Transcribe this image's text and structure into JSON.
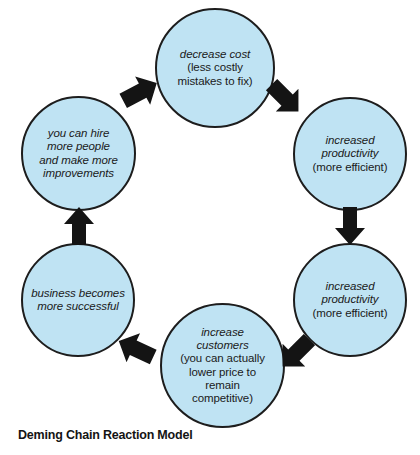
{
  "diagram": {
    "title": "Deming Chain Reaction Model",
    "fill_color": "#bfe3f3",
    "stroke_color": "#1d1d1d",
    "arrow_color": "#141414",
    "background_color": "#ffffff",
    "flow_direction": "clockwise",
    "nodes": [
      {
        "id": "decrease-cost",
        "lead": "decrease cost",
        "sub_line_1": "(less costly",
        "sub_line_2": "mistakes to fix)"
      },
      {
        "id": "increased-productivity-1",
        "lead_line_1": "increased",
        "lead_line_2": "productivity",
        "sub_line_1": "(more efficient)"
      },
      {
        "id": "increased-productivity-2",
        "lead_line_1": "increased",
        "lead_line_2": "productivity",
        "sub_line_1": "(more efficient)"
      },
      {
        "id": "increase-customers",
        "lead_line_1": "increase",
        "lead_line_2": "customers",
        "sub_line_1": "(you can actually",
        "sub_line_2": "lower price to",
        "sub_line_3": "remain",
        "sub_line_4": "competitive)"
      },
      {
        "id": "business-successful",
        "lead_line_1": "business becomes",
        "lead_line_2": "more successful"
      },
      {
        "id": "hire-more-people",
        "lead_line_1": "you can hire",
        "lead_line_2": "more people",
        "lead_line_3": "and make more",
        "lead_line_4": "improvements"
      }
    ],
    "arrows": [
      {
        "id": "arrow-to-increased-productivity-1",
        "direction": "down-right"
      },
      {
        "id": "arrow-to-increased-productivity-2",
        "direction": "down"
      },
      {
        "id": "arrow-to-increase-customers",
        "direction": "down-left"
      },
      {
        "id": "arrow-to-business-successful",
        "direction": "up-left"
      },
      {
        "id": "arrow-to-hire-more-people",
        "direction": "up"
      },
      {
        "id": "arrow-to-decrease-cost",
        "direction": "up-right"
      }
    ]
  }
}
